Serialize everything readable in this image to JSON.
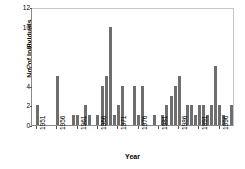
{
  "chart_data": {
    "type": "bar",
    "title": "",
    "xlabel": "Year",
    "ylabel": "No. of Individuals",
    "ylim": [
      0,
      12
    ],
    "ytick_labels": [
      "0",
      "2",
      "4",
      "6",
      "8",
      "10",
      "12"
    ],
    "ytick_values": [
      0,
      2,
      4,
      6,
      8,
      10,
      12
    ],
    "xtick_labels": [
      "1951",
      "1956",
      "1961",
      "1966",
      "1971",
      "1976",
      "1981",
      "1986",
      "1991",
      "1996"
    ],
    "xtick_values": [
      1951,
      1956,
      1961,
      1966,
      1971,
      1976,
      1981,
      1986,
      1991,
      1996
    ],
    "xlim": [
      1950,
      2000
    ],
    "grid": false,
    "legend": null,
    "bar_color": "#6e6e6e",
    "categories": [
      1951,
      1952,
      1953,
      1954,
      1955,
      1956,
      1957,
      1958,
      1959,
      1960,
      1961,
      1962,
      1963,
      1964,
      1965,
      1966,
      1967,
      1968,
      1969,
      1970,
      1971,
      1972,
      1973,
      1974,
      1975,
      1976,
      1977,
      1978,
      1979,
      1980,
      1981,
      1982,
      1983,
      1984,
      1985,
      1986,
      1987,
      1988,
      1989,
      1990,
      1991,
      1992,
      1993,
      1994,
      1995,
      1996,
      1997,
      1998,
      1999
    ],
    "values": [
      2,
      0,
      0,
      0,
      0,
      5,
      0,
      0,
      0,
      1,
      1,
      0,
      2,
      1,
      0,
      1,
      4,
      5,
      10,
      1,
      2,
      4,
      0,
      0,
      4,
      1,
      4,
      0,
      0,
      1,
      0,
      1,
      2,
      3,
      4,
      5,
      0,
      2,
      2,
      1,
      2,
      2,
      1,
      2,
      6,
      2,
      1,
      0,
      2
    ]
  }
}
